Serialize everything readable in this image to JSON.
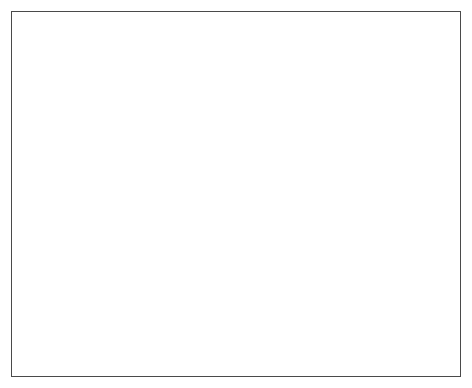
{
  "chart_data": {
    "type": "area",
    "title": "",
    "ylabel": "Thousand bbl/exploratory well",
    "xlabel": "",
    "xlim": [
      1938,
      1970
    ],
    "ylim": [
      0,
      1400
    ],
    "y_ticks": [
      0,
      200,
      400,
      600,
      800,
      1000,
      1200,
      1400
    ],
    "y_minor_step": 100,
    "x_ticks": [
      1938,
      1942,
      1946,
      1950,
      1954,
      1958,
      1962,
      1966,
      1970
    ],
    "x_minor_step": 2,
    "grid": false,
    "legend": null,
    "series_name": "Oil discovered per exploratory well",
    "line_color": "#1c1c1c",
    "fill_color": "#d9d9d9",
    "frame_color": "#4a4a4a",
    "x": [
      1938,
      1939,
      1940,
      1941,
      1942,
      1943,
      1944,
      1945,
      1946,
      1947,
      1948,
      1949,
      1950,
      1951,
      1952,
      1953,
      1954,
      1955,
      1956,
      1957,
      1958,
      1959,
      1960,
      1961,
      1962,
      1963,
      1964,
      1965,
      1966
    ],
    "values": [
      1400,
      470,
      910,
      620,
      440,
      390,
      400,
      330,
      250,
      175,
      290,
      275,
      190,
      118,
      115,
      115,
      118,
      125,
      140,
      120,
      85,
      82,
      95,
      78,
      70,
      90,
      78,
      72,
      30
    ]
  }
}
